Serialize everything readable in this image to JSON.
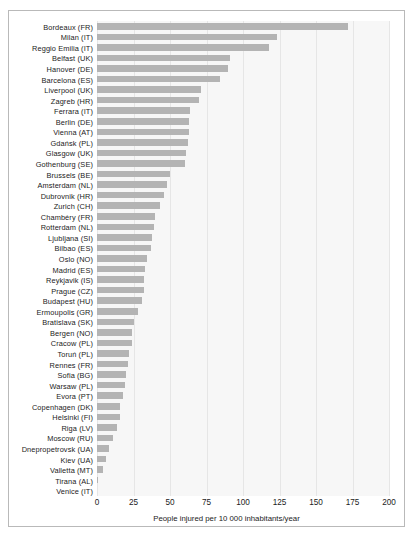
{
  "chart_data": {
    "type": "bar",
    "orientation": "horizontal",
    "title": "",
    "subtitle": "",
    "xlabel": "People injured per 10 000 inhabitants/year",
    "ylabel": "",
    "xlim": [
      0,
      200
    ],
    "xticks": [
      0,
      25,
      50,
      75,
      100,
      125,
      150,
      175,
      200
    ],
    "grid": true,
    "legend": null,
    "bar_color": "#b4b4b4",
    "panel_color": "#f7f7f7",
    "categories": [
      "Bordeaux (FR)",
      "Milan (IT)",
      "Reggio Emilia (IT)",
      "Belfast (UK)",
      "Hanover (DE)",
      "Barcelona (ES)",
      "Liverpool (UK)",
      "Zagreb (HR)",
      "Ferrara (IT)",
      "Berlin (DE)",
      "Vienna (AT)",
      "Gdańsk (PL)",
      "Glasgow (UK)",
      "Gothenburg (SE)",
      "Brussels (BE)",
      "Amsterdam (NL)",
      "Dubrovnik (HR)",
      "Zurich (CH)",
      "Chambéry (FR)",
      "Rotterdam (NL)",
      "Ljubljana (SI)",
      "Bilbao (ES)",
      "Oslo (NO)",
      "Madrid (ES)",
      "Reykjavik (IS)",
      "Prague (CZ)",
      "Budapest (HU)",
      "Ermoupolis (GR)",
      "Bratislava (SK)",
      "Bergen (NO)",
      "Cracow (PL)",
      "Toruń (PL)",
      "Rennes (FR)",
      "Sofia (BG)",
      "Warsaw (PL)",
      "Evora (PT)",
      "Copenhagen (DK)",
      "Helsinki (FI)",
      "Riga (LV)",
      "Moscow (RU)",
      "Dnepropetrovsk (UA)",
      "Kiev (UA)",
      "Valletta (MT)",
      "Tirana (AL)",
      "Venice (IT)"
    ],
    "values": [
      172,
      123,
      118,
      91,
      90,
      84,
      71,
      70,
      64,
      63,
      63,
      62,
      61,
      60,
      50,
      48,
      46,
      43,
      40,
      39,
      38,
      37,
      34,
      33,
      32,
      32,
      31,
      28,
      25,
      24,
      24,
      22,
      21,
      20,
      19,
      18,
      16,
      16,
      14,
      11,
      8,
      6,
      4,
      1,
      0
    ]
  }
}
